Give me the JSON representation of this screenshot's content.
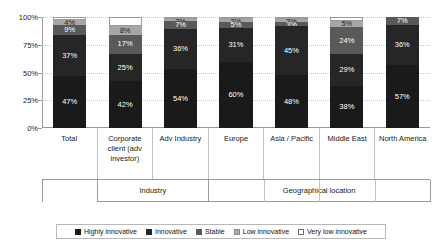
{
  "chart_data": {
    "type": "bar",
    "title": "",
    "subtitle": "",
    "xlabel": "",
    "ylabel": "",
    "stacked": true,
    "stack_mode": "percent",
    "grid": true,
    "legend_position": "bottom",
    "ylim": [
      0,
      100
    ],
    "yticks": [
      "0%",
      "25%",
      "50%",
      "75%",
      "100%"
    ],
    "ytick_values": [
      0,
      25,
      50,
      75,
      100
    ],
    "categories": [
      "Total",
      "Corporate client (adv investor)",
      "Adv Industry",
      "Europe",
      "Asia / Pacific",
      "Middle East",
      "North America"
    ],
    "series": [
      {
        "name": "Highly innovative",
        "color": "#1a1a1a",
        "values": [
          47,
          42,
          54,
          60,
          48,
          38,
          57
        ]
      },
      {
        "name": "Innovative",
        "color": "#262626",
        "values": [
          37,
          25,
          36,
          31,
          45,
          29,
          36
        ]
      },
      {
        "name": "Stable",
        "color": "#595959",
        "values": [
          9,
          17,
          7,
          5,
          3,
          24,
          7
        ]
      },
      {
        "name": "Low innovative",
        "color": "#a6a6a6",
        "values": [
          4,
          8,
          2,
          3,
          3,
          5,
          0
        ]
      },
      {
        "name": "Very low innovative",
        "color": "#ffffff",
        "values": [
          3,
          8,
          1,
          1,
          1,
          4,
          0
        ]
      }
    ],
    "data_labels": [
      [
        "47%",
        "37%",
        "9%",
        "4%",
        ""
      ],
      [
        "42%",
        "25%",
        "17%",
        "8%",
        ""
      ],
      [
        "54%",
        "36%",
        "7%",
        "2%",
        ""
      ],
      [
        "60%",
        "31%",
        "5%",
        "3%",
        ""
      ],
      [
        "48%",
        "45%",
        "3%",
        "3%",
        ""
      ],
      [
        "38%",
        "29%",
        "24%",
        "5%",
        ""
      ],
      [
        "57%",
        "36%",
        "7%",
        "",
        ""
      ]
    ],
    "groups": [
      {
        "label": "Industry",
        "span": 2,
        "start": 1
      },
      {
        "label": "Geographical location",
        "span": 4,
        "start": 3
      }
    ],
    "legend": [
      {
        "label": "Highly innovative",
        "color": "#1a1a1a",
        "border": "#1a1a1a"
      },
      {
        "label": "Innovative",
        "color": "#262626",
        "border": "#262626"
      },
      {
        "label": "Stable",
        "color": "#595959",
        "border": "#595959"
      },
      {
        "label": "Low innovative",
        "color": "#a6a6a6",
        "border": "#8a8a8a"
      },
      {
        "label": "Very low innovative",
        "color": "#ffffff",
        "border": "#6e6e6e"
      }
    ]
  }
}
